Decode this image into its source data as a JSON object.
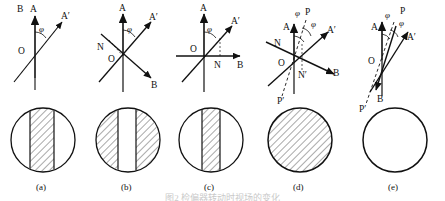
{
  "figure": {
    "caption": "图2  检偏器转动时视场的变化",
    "angle_symbol": "φ",
    "panels": [
      {
        "id": "a",
        "label": "(a)",
        "axis_labels": {
          "b": "B",
          "a": "A",
          "a_prime": "A′",
          "origin": "O"
        },
        "angles": [
          "φ"
        ],
        "field": {
          "pattern": "center-band-hatched",
          "description": "circle with hatched vertical band in center"
        }
      },
      {
        "id": "b",
        "label": "(b)",
        "axis_labels": {
          "a": "A",
          "a_prime": "A′",
          "n": "N",
          "b": "B",
          "origin": "O"
        },
        "angles": [
          "φ"
        ],
        "field": {
          "pattern": "sides-hatched",
          "description": "circle hatched except clear vertical band in center"
        }
      },
      {
        "id": "c",
        "label": "(c)",
        "axis_labels": {
          "a": "A",
          "a_prime": "A′",
          "n": "N",
          "b": "B",
          "origin": "O"
        },
        "angles": [
          "φ"
        ],
        "field": {
          "pattern": "narrow-center-band-hatched",
          "description": "circle with narrow hatched vertical band in center"
        }
      },
      {
        "id": "d",
        "label": "(d)",
        "axis_labels": {
          "a": "A",
          "a_prime": "A′",
          "n": "N",
          "n_prime": "N′",
          "b": "B",
          "p": "P",
          "p_prime": "P′",
          "origin": "O"
        },
        "angles": [
          "φ",
          "φ"
        ],
        "field": {
          "pattern": "fully-hatched",
          "description": "circle completely hatched"
        }
      },
      {
        "id": "e",
        "label": "(e)",
        "axis_labels": {
          "a": "A",
          "a_prime": "A′",
          "b": "B",
          "p": "P",
          "p_prime": "P′",
          "origin": "O"
        },
        "angles": [
          "φ",
          "φ"
        ],
        "field": {
          "pattern": "empty",
          "description": "empty circle, no hatching"
        }
      }
    ]
  },
  "colors": {
    "stroke": "#111111",
    "hatch": "#4a4a4a",
    "background": "#ffffff"
  }
}
